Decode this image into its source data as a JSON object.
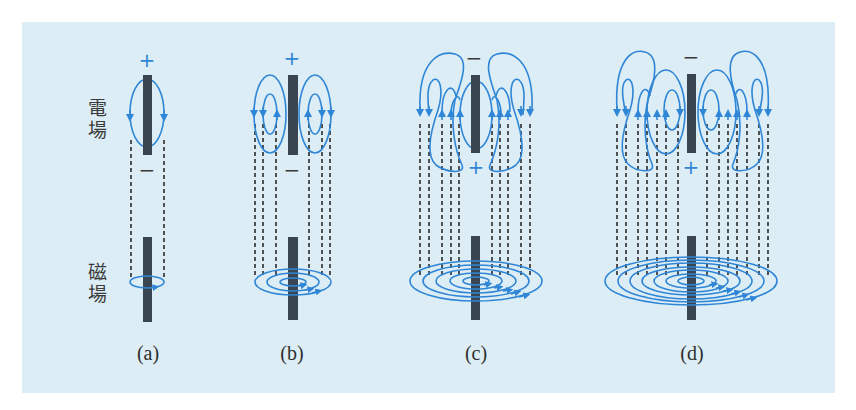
{
  "figure": {
    "background": "#dcedf5",
    "field_line_color": "#2f86d6",
    "antenna_color": "#3a4552",
    "dashed_line_color": "#2b2b2b",
    "row_labels": {
      "electric": {
        "line1": "電",
        "line2": "場"
      },
      "magnetic": {
        "line1": "磁",
        "line2": "場"
      }
    },
    "panels": [
      {
        "id": "a",
        "caption": "(a)",
        "top_charge": "+",
        "bottom_charge": "−",
        "magnetic_loops": 1
      },
      {
        "id": "b",
        "caption": "(b)",
        "top_charge": "+",
        "bottom_charge": "−",
        "magnetic_loops": 3
      },
      {
        "id": "c",
        "caption": "(c)",
        "top_charge": "−",
        "bottom_charge": "+",
        "magnetic_loops": 5
      },
      {
        "id": "d",
        "caption": "(d)",
        "top_charge": "−",
        "bottom_charge": "+",
        "magnetic_loops": 7
      }
    ]
  }
}
